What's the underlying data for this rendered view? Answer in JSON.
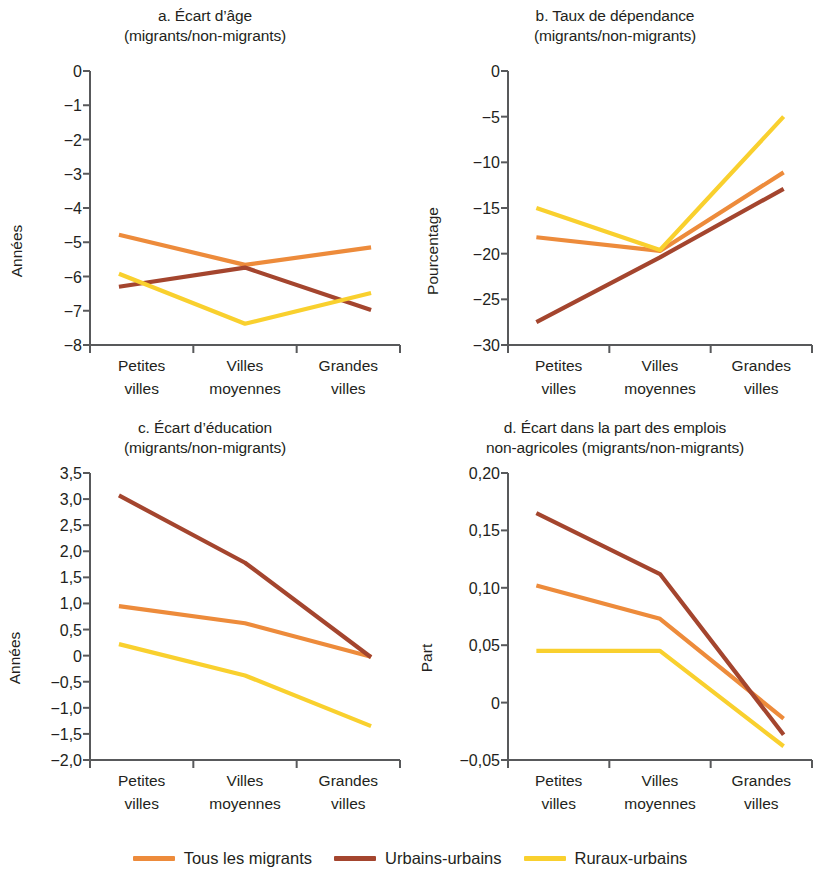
{
  "series_meta": [
    {
      "key": "tous",
      "label": "Tous les migrants",
      "color": "#ED8B3B"
    },
    {
      "key": "urbains",
      "label": "Urbains-urbains",
      "color": "#A4452E"
    },
    {
      "key": "ruraux",
      "label": "Ruraux-urbains",
      "color": "#F9D02E"
    }
  ],
  "categories": [
    "Petites villes",
    "Villes moyennes",
    "Grandes villes"
  ],
  "category_lines": [
    {
      "l1": "Petites",
      "l2": "villes"
    },
    {
      "l1": "Villes",
      "l2": "moyennes"
    },
    {
      "l1": "Grandes",
      "l2": "villes"
    }
  ],
  "legend": {
    "items": [
      {
        "label": "Tous les migrants",
        "color": "#ED8B3B"
      },
      {
        "label": "Urbains-urbains",
        "color": "#A4452E"
      },
      {
        "label": "Ruraux-urbains",
        "color": "#F9D02E"
      }
    ]
  },
  "panels": {
    "a": {
      "title_line1": "a. Écart d’âge",
      "title_line2": "(migrants/non-migrants)",
      "ylabel": "Années",
      "yticks": [
        "0",
        "−1",
        "−2",
        "−3",
        "−4",
        "−5",
        "−6",
        "−7",
        "−8"
      ]
    },
    "b": {
      "title_line1": "b. Taux de dépendance",
      "title_line2": "(migrants/non-migrants)",
      "ylabel": "Pourcentage",
      "yticks": [
        "0",
        "−5",
        "−10",
        "−15",
        "−20",
        "−25",
        "−30"
      ]
    },
    "c": {
      "title_line1": "c. Écart d’éducation",
      "title_line2": "(migrants/non-migrants)",
      "ylabel": "Années",
      "yticks": [
        "3,5",
        "3,0",
        "2,5",
        "2,0",
        "1,5",
        "1,0",
        "0,5",
        "0",
        "−0,5",
        "−1,0",
        "−1,5",
        "−2,0"
      ]
    },
    "d": {
      "title_line1": "d. Écart dans la part des emplois",
      "title_line2": "non-agricoles (migrants/non-migrants)",
      "ylabel": "Part",
      "yticks": [
        "0,20",
        "0,15",
        "0,10",
        "0,05",
        "0",
        "−0,05"
      ]
    }
  },
  "chart_data": [
    {
      "id": "a",
      "type": "line",
      "title": "a. Écart d’âge (migrants/non-migrants)",
      "xlabel": "",
      "ylabel": "Années",
      "categories": [
        "Petites villes",
        "Villes moyennes",
        "Grandes villes"
      ],
      "ylim": [
        -8,
        0
      ],
      "yticks": [
        0,
        -1,
        -2,
        -3,
        -4,
        -5,
        -6,
        -7,
        -8
      ],
      "grid": false,
      "legend_position": "bottom",
      "series": [
        {
          "name": "Tous les migrants",
          "color": "#ED8B3B",
          "values": [
            -4.78,
            -5.66,
            -5.15
          ]
        },
        {
          "name": "Urbains-urbains",
          "color": "#A4452E",
          "values": [
            -6.3,
            -5.74,
            -6.98
          ]
        },
        {
          "name": "Ruraux-urbains",
          "color": "#F9D02E",
          "values": [
            -5.92,
            -7.38,
            -6.48
          ]
        }
      ]
    },
    {
      "id": "b",
      "type": "line",
      "title": "b. Taux de dépendance (migrants/non-migrants)",
      "xlabel": "",
      "ylabel": "Pourcentage",
      "categories": [
        "Petites villes",
        "Villes moyennes",
        "Grandes villes"
      ],
      "ylim": [
        -30,
        0
      ],
      "yticks": [
        0,
        -5,
        -10,
        -15,
        -20,
        -25,
        -30
      ],
      "grid": false,
      "legend_position": "bottom",
      "series": [
        {
          "name": "Tous les migrants",
          "color": "#ED8B3B",
          "values": [
            -18.2,
            -19.7,
            -11.1
          ]
        },
        {
          "name": "Urbains-urbains",
          "color": "#A4452E",
          "values": [
            -27.5,
            -20.4,
            -12.9
          ]
        },
        {
          "name": "Ruraux-urbains",
          "color": "#F9D02E",
          "values": [
            -15.0,
            -19.6,
            -5.0
          ]
        }
      ]
    },
    {
      "id": "c",
      "type": "line",
      "title": "c. Écart d’éducation (migrants/non-migrants)",
      "xlabel": "",
      "ylabel": "Années",
      "categories": [
        "Petites villes",
        "Villes moyennes",
        "Grandes villes"
      ],
      "ylim": [
        -2.0,
        3.5
      ],
      "yticks": [
        3.5,
        3.0,
        2.5,
        2.0,
        1.5,
        1.0,
        0.5,
        0,
        -0.5,
        -1.0,
        -1.5,
        -2.0
      ],
      "grid": false,
      "legend_position": "bottom",
      "series": [
        {
          "name": "Tous les migrants",
          "color": "#ED8B3B",
          "values": [
            0.95,
            0.62,
            -0.02
          ]
        },
        {
          "name": "Urbains-urbains",
          "color": "#A4452E",
          "values": [
            3.07,
            1.78,
            -0.03
          ]
        },
        {
          "name": "Ruraux-urbains",
          "color": "#F9D02E",
          "values": [
            0.22,
            -0.38,
            -1.35
          ]
        }
      ]
    },
    {
      "id": "d",
      "type": "line",
      "title": "d. Écart dans la part des emplois non-agricoles (migrants/non-migrants)",
      "xlabel": "",
      "ylabel": "Part",
      "categories": [
        "Petites villes",
        "Villes moyennes",
        "Grandes villes"
      ],
      "ylim": [
        -0.05,
        0.2
      ],
      "yticks": [
        0.2,
        0.15,
        0.1,
        0.05,
        0,
        -0.05
      ],
      "grid": false,
      "legend_position": "bottom",
      "series": [
        {
          "name": "Tous les migrants",
          "color": "#ED8B3B",
          "values": [
            0.102,
            0.073,
            -0.014
          ]
        },
        {
          "name": "Urbains-urbains",
          "color": "#A4452E",
          "values": [
            0.165,
            0.112,
            -0.028
          ]
        },
        {
          "name": "Ruraux-urbains",
          "color": "#F9D02E",
          "values": [
            0.045,
            0.045,
            -0.038
          ]
        }
      ]
    }
  ]
}
